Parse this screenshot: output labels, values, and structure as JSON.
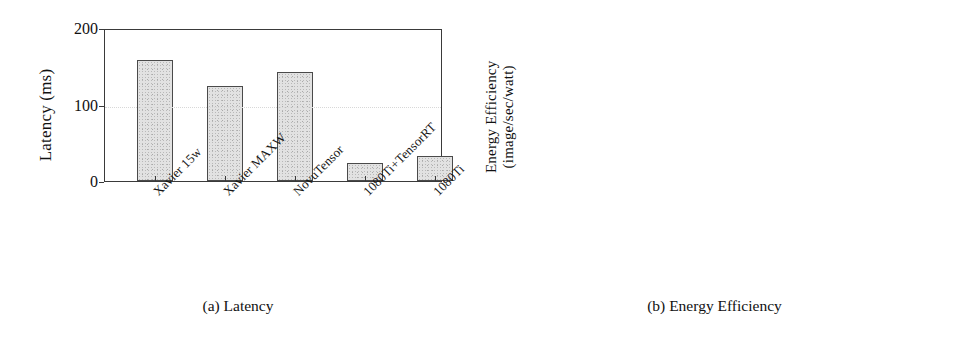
{
  "figure": {
    "panels": [
      {
        "id": "a",
        "caption": "(a) Latency",
        "ylabel": "Latency (ms)",
        "ylabel_line2": ""
      },
      {
        "id": "b",
        "caption": "(b) Energy Efficiency",
        "ylabel": "Energy Efficiency",
        "ylabel_line2": "(image/sec/watt)"
      }
    ]
  },
  "chart_data": [
    {
      "type": "bar",
      "panel": "a",
      "title": "(a) Latency",
      "xlabel": "",
      "ylabel": "Latency (ms)",
      "ylim": [
        0,
        200
      ],
      "yticks": [
        0,
        100,
        200
      ],
      "ytick_labels": [
        "0",
        "100",
        "200"
      ],
      "grid": true,
      "legend": "none",
      "categories": [
        "Xavier 15w",
        "Xavier MAXW",
        "NovuTensor",
        "1080Ti+TensorRT",
        "1080Ti"
      ],
      "values": [
        158,
        124,
        142,
        23,
        33
      ],
      "bar_color": "#e2e2e2",
      "bar_edge_color": "#4a4a4a"
    },
    {
      "type": "bar",
      "panel": "b",
      "title": "(b) Energy Efficiency",
      "xlabel": "",
      "ylabel": "Energy Efficiency (image/sec/watt)",
      "ylim": [
        0,
        1
      ],
      "yticks": [
        0,
        0.2,
        0.4,
        0.6,
        0.8,
        1
      ],
      "ytick_labels": [
        "0",
        "0.2",
        "0.4",
        "0.6",
        "0.8",
        "1"
      ],
      "grid": true,
      "legend": "none",
      "categories": [
        "Xavier 15w",
        "Xavier MAXW",
        "NovuTensor",
        "1080Ti+TensorRT",
        "1080Ti"
      ],
      "values": [
        0.825,
        0.53,
        0.695,
        0.345,
        0.115
      ],
      "bar_color": "#e2e2e2",
      "bar_edge_color": "#4a4a4a"
    }
  ]
}
